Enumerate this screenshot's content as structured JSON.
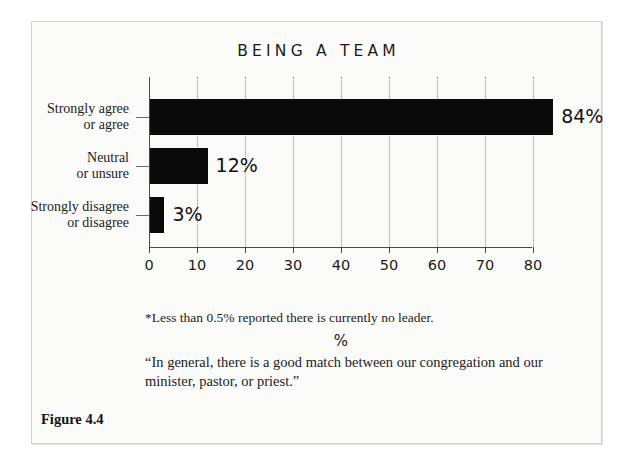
{
  "figure": {
    "caption": "Figure 4.4",
    "footnote": "*Less than 0.5% reported there is currently no leader.",
    "quote": "“In general, there is a good match between our congregation and our minister, pastor, or priest.”"
  },
  "chart_data": {
    "type": "bar",
    "orientation": "horizontal",
    "title": "BEING A TEAM",
    "categories": [
      "Strongly agree or agree",
      "Neutral or unsure",
      "Strongly disagree or disagree"
    ],
    "category_lines": [
      [
        "Strongly agree",
        "or agree"
      ],
      [
        "Neutral",
        "or unsure"
      ],
      [
        "Strongly disagree",
        "or disagree"
      ]
    ],
    "values": [
      84,
      12,
      3
    ],
    "value_labels": [
      "84%",
      "12%",
      "3%"
    ],
    "xlabel": "%",
    "ylabel": "",
    "xlim": [
      0,
      80
    ],
    "xticks": [
      0,
      10,
      20,
      30,
      40,
      50,
      60,
      70,
      80
    ],
    "xticklabels": [
      "0",
      "10",
      "20",
      "30",
      "40",
      "50",
      "60",
      "70",
      "80"
    ],
    "grid": "vertical-dotted",
    "legend": "none",
    "bar_color": "#0a0a0a"
  }
}
